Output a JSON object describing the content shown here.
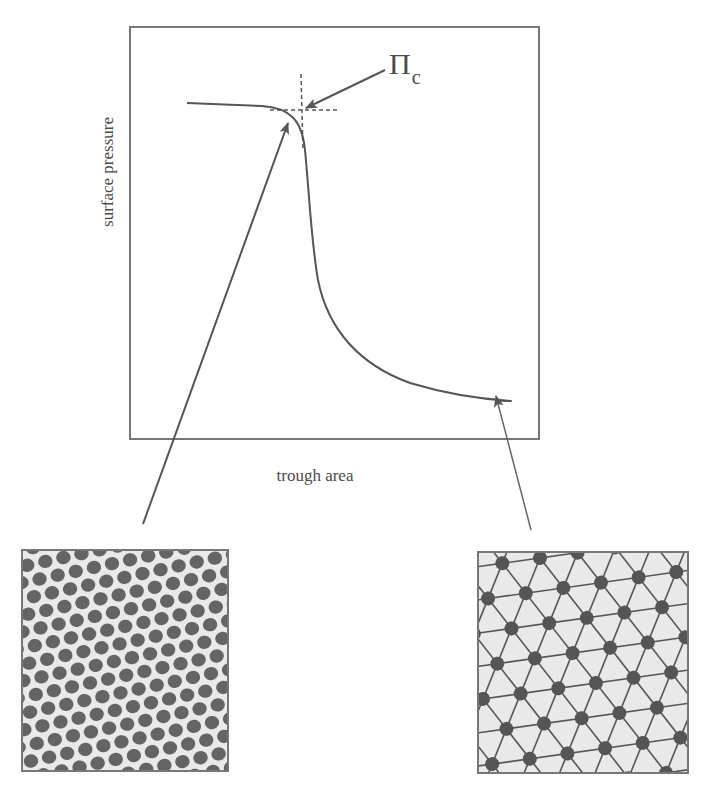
{
  "diagram": {
    "y_axis_label": "surface pressure",
    "x_axis_label": "trough area",
    "critical_pressure_label": {
      "symbol": "Π",
      "subscript": "c"
    },
    "curve": {
      "description": "surface pressure vs trough area isotherm; plateau at high pressure for small area, steep drop, then gradual decline toward large area",
      "critical_point_marked_with": "dashed tangent lines"
    },
    "insets": [
      {
        "name": "close-packed-monolayer",
        "description": "dense hexagonal array of dark dots (compressed state)",
        "linked_to": "curve knee near critical pressure"
      },
      {
        "name": "expanded-network",
        "description": "dots connected by triangular line network (expanded state)",
        "linked_to": "curve tail at large trough area"
      }
    ],
    "colors": {
      "lines": "#555555",
      "dots": "#555555",
      "inset_background": "#e9e9e9"
    }
  }
}
